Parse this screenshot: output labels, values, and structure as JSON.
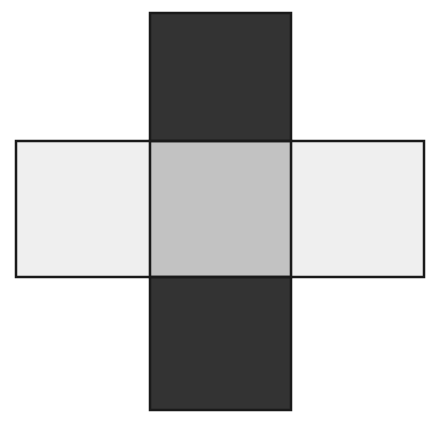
{
  "figure": {
    "canvas": {
      "width": 431,
      "height": 425,
      "background_color": "#ffffff"
    },
    "stroke": {
      "color": "#1a1a1a",
      "width": 2.5
    },
    "shapes": [
      {
        "id": "vertical-rectangle",
        "name": "vertical-rectangle",
        "orientation": "vertical",
        "fill_color": "#333333",
        "fill_opacity": 1,
        "x": 150,
        "y": 13,
        "width": 141,
        "height": 397,
        "z_order": 1
      },
      {
        "id": "horizontal-rectangle",
        "name": "horizontal-rectangle",
        "orientation": "horizontal",
        "fill_color": "#ebebeb",
        "fill_opacity": 0.78,
        "x": 16,
        "y": 141,
        "width": 408,
        "height": 136,
        "z_order": 2
      }
    ],
    "overlap_region": {
      "id": "overlap-square",
      "name": "overlap-square",
      "fill_color": "#808080",
      "x": 150,
      "y": 141,
      "width": 141,
      "height": 136
    }
  }
}
